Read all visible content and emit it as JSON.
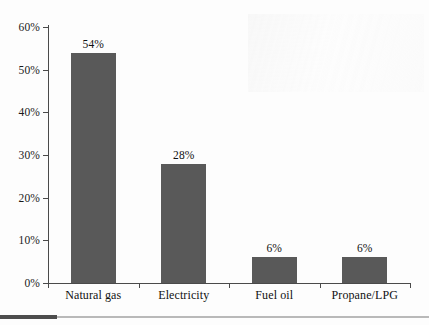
{
  "chart_data": {
    "type": "bar",
    "title": "",
    "subtitle": "",
    "xlabel": "",
    "ylabel": "",
    "categories": [
      "Natural gas",
      "Electricity",
      "Fuel oil",
      "Propane/LPG"
    ],
    "values": [
      54,
      28,
      6,
      6
    ],
    "value_labels": [
      "54%",
      "28%",
      "6%",
      "6%"
    ],
    "ylim": [
      0,
      60
    ],
    "ytick_values": [
      0,
      10,
      20,
      30,
      40,
      50,
      60
    ],
    "ytick_labels": [
      "0%",
      "10%",
      "20%",
      "30%",
      "40%",
      "50%",
      "60%"
    ],
    "grid": false,
    "legend": false,
    "legend_position": "none",
    "bar_color": "#595959",
    "axis_color": "#4a4a4a",
    "text_color": "#111111",
    "background_color": "#fdfdfd"
  },
  "footer": {
    "accent_color": "#4d4d4d",
    "rule_color": "#b9b9b9"
  }
}
